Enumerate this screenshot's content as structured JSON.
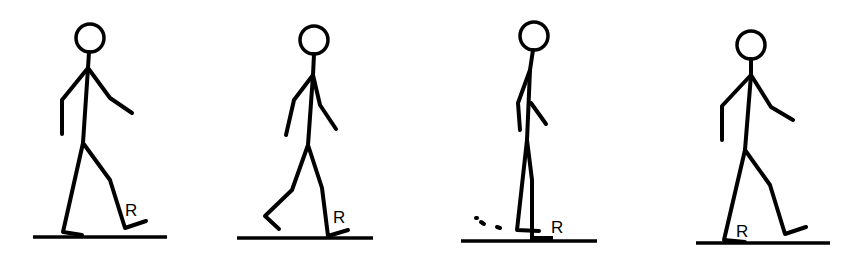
{
  "figure": {
    "frames": [
      {
        "id": "frame-1",
        "phase": "right swing / terminal swing",
        "leg_label": "R"
      },
      {
        "id": "frame-2",
        "phase": "right initial contact",
        "leg_label": "R"
      },
      {
        "id": "frame-3",
        "phase": "right midstance",
        "leg_label": "R"
      },
      {
        "id": "frame-4",
        "phase": "left stance, right swing",
        "leg_label": "R"
      }
    ]
  },
  "colors": {
    "stroke": "#000000",
    "background": "#ffffff"
  }
}
